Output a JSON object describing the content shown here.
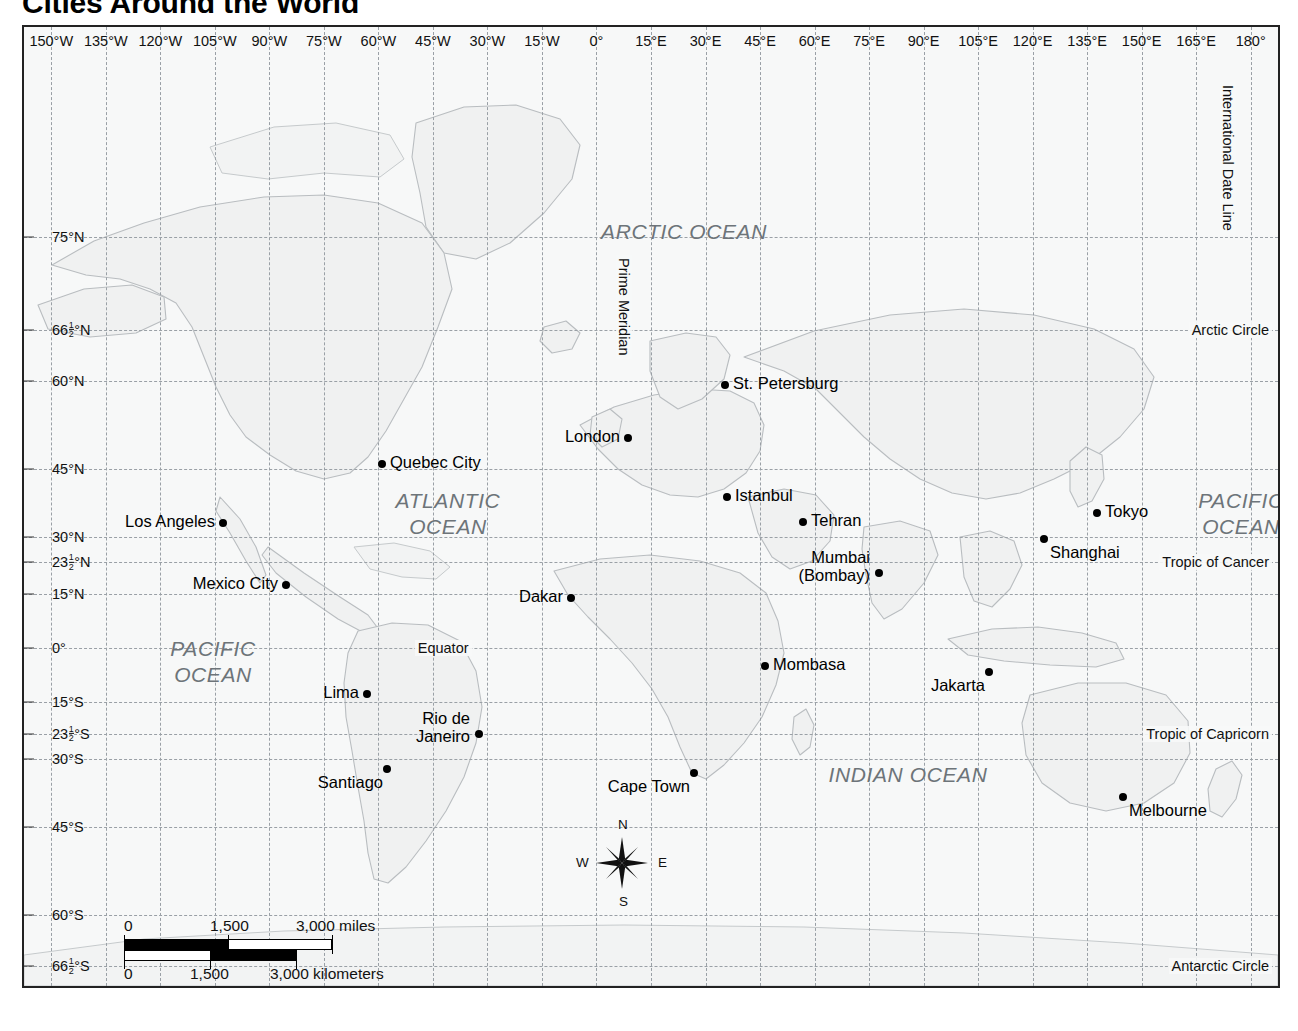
{
  "title": "Cities Around the World",
  "projection_label": "Mercator projection",
  "graticule": {
    "longitude_labels": [
      "150°W",
      "135°W",
      "120°W",
      "105°W",
      "90°W",
      "75°W",
      "60°W",
      "45°W",
      "30°W",
      "15°W",
      "0°",
      "15°E",
      "30°E",
      "45°E",
      "60°E",
      "75°E",
      "90°E",
      "105°E",
      "120°E",
      "135°E",
      "150°E",
      "165°E",
      "180°"
    ],
    "longitude_values": [
      -150,
      -135,
      -120,
      -105,
      -90,
      -75,
      -60,
      -45,
      -30,
      -15,
      0,
      15,
      30,
      45,
      60,
      75,
      90,
      105,
      120,
      135,
      150,
      165,
      180
    ],
    "latitude_labels": [
      "75°N",
      "66½°N",
      "60°N",
      "45°N",
      "30°N",
      "23½°N",
      "15°N",
      "0°",
      "15°S",
      "23½°S",
      "30°S",
      "45°S",
      "60°S",
      "66½°S"
    ],
    "latitude_values": [
      75,
      66.5,
      60,
      45,
      30,
      23.5,
      15,
      0,
      -15,
      -23.5,
      -30,
      -45,
      -60,
      -66.5
    ]
  },
  "reference_lines": [
    {
      "name": "Arctic Circle",
      "label": "Arctic Circle",
      "lat": 66.5
    },
    {
      "name": "Tropic of Cancer",
      "label": "Tropic of Cancer",
      "lat": 23.5
    },
    {
      "name": "Equator",
      "label": "Equator",
      "lat": 0
    },
    {
      "name": "Tropic of Capricorn",
      "label": "Tropic of Capricorn",
      "lat": -23.5
    },
    {
      "name": "Antarctic Circle",
      "label": "Antarctic Circle",
      "lat": -66.5
    }
  ],
  "meridian_labels": [
    {
      "name": "Prime Meridian",
      "label": "Prime Meridian",
      "lon": 0
    },
    {
      "name": "International Date Line",
      "label": "International Date Line",
      "lon": 180
    }
  ],
  "oceans": [
    {
      "label": "ARCTIC OCEAN",
      "x": 660,
      "y": 205
    },
    {
      "label": "ATLANTIC\nOCEAN",
      "x": 424,
      "y": 487
    },
    {
      "label": "PACIFIC\nOCEAN",
      "x": 1217,
      "y": 487
    },
    {
      "label": "PACIFIC\nOCEAN",
      "x": 189,
      "y": 635
    },
    {
      "label": "INDIAN OCEAN",
      "x": 884,
      "y": 748
    }
  ],
  "cities": [
    {
      "name": "St. Petersburg",
      "label": "St. Petersburg",
      "x": 701,
      "y": 358,
      "anchor": "right"
    },
    {
      "name": "London",
      "label": "London",
      "x": 604,
      "y": 411,
      "anchor": "left"
    },
    {
      "name": "Quebec City",
      "label": "Quebec City",
      "x": 358,
      "y": 437,
      "anchor": "right"
    },
    {
      "name": "Istanbul",
      "label": "Istanbul",
      "x": 703,
      "y": 470,
      "anchor": "right"
    },
    {
      "name": "Tehran",
      "label": "Tehran",
      "x": 779,
      "y": 495,
      "anchor": "right"
    },
    {
      "name": "Tokyo",
      "label": "Tokyo",
      "x": 1073,
      "y": 486,
      "anchor": "right"
    },
    {
      "name": "Los Angeles",
      "label": "Los Angeles",
      "x": 199,
      "y": 496,
      "anchor": "left"
    },
    {
      "name": "Shanghai",
      "label": "Shanghai",
      "x": 1020,
      "y": 512,
      "anchor": "below-right"
    },
    {
      "name": "Mexico City",
      "label": "Mexico City",
      "x": 262,
      "y": 558,
      "anchor": "left"
    },
    {
      "name": "Dakar",
      "label": "Dakar",
      "x": 547,
      "y": 571,
      "anchor": "left"
    },
    {
      "name": "Mumbai (Bombay)",
      "label": "Mumbai\n(Bombay)",
      "x": 855,
      "y": 546,
      "anchor": "two-left"
    },
    {
      "name": "Mombasa",
      "label": "Mombasa",
      "x": 741,
      "y": 639,
      "anchor": "right"
    },
    {
      "name": "Jakarta",
      "label": "Jakarta",
      "x": 965,
      "y": 645,
      "anchor": "below-left"
    },
    {
      "name": "Lima",
      "label": "Lima",
      "x": 343,
      "y": 667,
      "anchor": "left"
    },
    {
      "name": "Rio de Janeiro",
      "label": "Rio de\nJaneiro",
      "x": 455,
      "y": 707,
      "anchor": "two-left"
    },
    {
      "name": "Santiago",
      "label": "Santiago",
      "x": 363,
      "y": 742,
      "anchor": "below-left"
    },
    {
      "name": "Cape Town",
      "label": "Cape Town",
      "x": 670,
      "y": 746,
      "anchor": "below-left"
    },
    {
      "name": "Melbourne",
      "label": "Melbourne",
      "x": 1099,
      "y": 770,
      "anchor": "below-right"
    }
  ],
  "compass": {
    "north": "N",
    "south": "S",
    "east": "E",
    "west": "W"
  },
  "scale": {
    "miles_ticks": [
      "0",
      "1,500",
      "3,000 miles"
    ],
    "km_ticks": [
      "0",
      "1,500",
      "3,000 kilometers"
    ]
  },
  "colors": {
    "background": "#ffffff",
    "map_fill": "#f7f8f8",
    "land_fill": "#f0f1f1",
    "coastline": "#b9bdc0",
    "graticule": "#9aa0a6",
    "text": "#111111",
    "ocean_text": "#6d7479",
    "frame": "#222222"
  }
}
